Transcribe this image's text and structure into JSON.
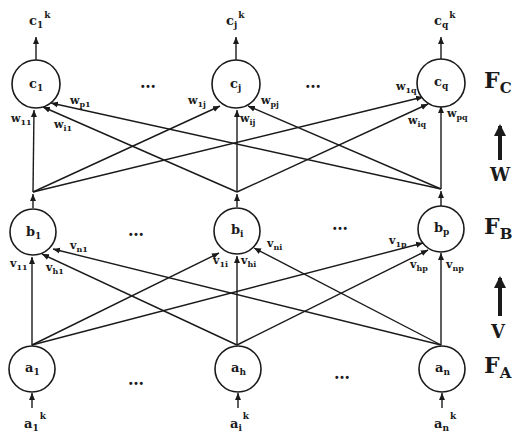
{
  "diagram": {
    "type": "three-layer network",
    "layers": {
      "FC": {
        "label": "F",
        "sub": "C",
        "nodes": [
          {
            "base": "c",
            "sub": "1",
            "out_base": "c",
            "out_sub": "1",
            "out_sup": "k"
          },
          {
            "base": "c",
            "sub": "j",
            "out_base": "c",
            "out_sub": "j",
            "out_sup": "k"
          },
          {
            "base": "c",
            "sub": "q",
            "out_base": "c",
            "out_sub": "q",
            "out_sup": "k"
          }
        ]
      },
      "FB": {
        "label": "F",
        "sub": "B",
        "nodes": [
          {
            "base": "b",
            "sub": "1"
          },
          {
            "base": "b",
            "sub": "i"
          },
          {
            "base": "b",
            "sub": "p"
          }
        ]
      },
      "FA": {
        "label": "F",
        "sub": "A",
        "nodes": [
          {
            "base": "a",
            "sub": "1",
            "in_base": "a",
            "in_sub": "1",
            "in_sup": "k"
          },
          {
            "base": "a",
            "sub": "h",
            "in_base": "a",
            "in_sub": "i",
            "in_sup": "k"
          },
          {
            "base": "a",
            "sub": "n",
            "in_base": "a",
            "in_sub": "n",
            "in_sup": "k"
          }
        ]
      }
    },
    "ellipsis": "…",
    "weights": {
      "W": {
        "label": "W",
        "edges": [
          {
            "base": "w",
            "sub": "11"
          },
          {
            "base": "w",
            "sub": "p1"
          },
          {
            "base": "w",
            "sub": "i1"
          },
          {
            "base": "w",
            "sub": "1j"
          },
          {
            "base": "w",
            "sub": "ij"
          },
          {
            "base": "w",
            "sub": "pj"
          },
          {
            "base": "w",
            "sub": "1q"
          },
          {
            "base": "w",
            "sub": "iq"
          },
          {
            "base": "w",
            "sub": "pq"
          }
        ]
      },
      "V": {
        "label": "V",
        "edges": [
          {
            "base": "v",
            "sub": "11"
          },
          {
            "base": "v",
            "sub": "n1"
          },
          {
            "base": "v",
            "sub": "h1"
          },
          {
            "base": "v",
            "sub": "1i"
          },
          {
            "base": "v",
            "sub": "hi"
          },
          {
            "base": "v",
            "sub": "ni"
          },
          {
            "base": "v",
            "sub": "1p"
          },
          {
            "base": "v",
            "sub": "hp"
          },
          {
            "base": "v",
            "sub": "np"
          }
        ]
      }
    }
  }
}
